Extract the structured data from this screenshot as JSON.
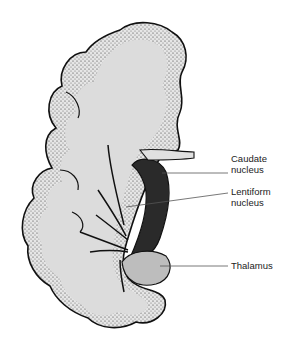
{
  "figure": {
    "colors": {
      "white_matter": "#dcdcdc",
      "cortex_stipple": "#b0b0b0",
      "outline": "#111111",
      "leader_line": "#555555",
      "background": "#ffffff"
    },
    "labels": [
      {
        "id": "caudate",
        "line1": "Caudate",
        "line2": "nucleus"
      },
      {
        "id": "lentiform",
        "line1": "Lentiform",
        "line2": "nucleus"
      },
      {
        "id": "thalamus",
        "line1": "Thalamus",
        "line2": ""
      }
    ]
  }
}
